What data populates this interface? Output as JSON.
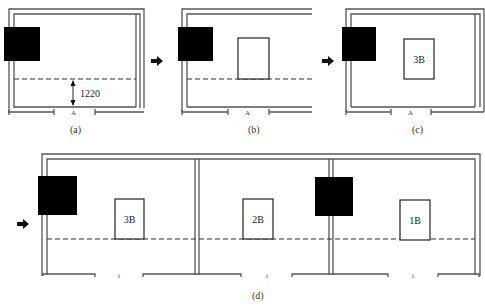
{
  "panels": [
    {
      "id": "a",
      "caption": "(a)",
      "dimension_label": "1220",
      "box_label": ""
    },
    {
      "id": "b",
      "caption": "(b)",
      "box_label": ""
    },
    {
      "id": "c",
      "caption": "(c)",
      "box_label": "3B"
    },
    {
      "id": "d",
      "caption": "(d)",
      "box_labels": [
        "3B",
        "2B",
        "1B"
      ]
    }
  ],
  "colors": {
    "block": "#000000",
    "wall": "#555555",
    "dashed_line": "#333333"
  }
}
